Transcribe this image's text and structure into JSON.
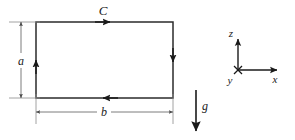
{
  "figure": {
    "type": "physics-diagram",
    "background_color": "#ffffff",
    "line_color": "#1a1a1a",
    "dimension_line_color": "#6e6e6e",
    "labels": {
      "contour": "C",
      "height": "a",
      "width": "b",
      "gravity": "g",
      "axis_z": "z",
      "axis_x": "x",
      "axis_y": "y"
    },
    "contour": {
      "name": "C",
      "shape": "rectangle",
      "orientation": "counterclockwise",
      "left": 36,
      "right": 173,
      "top": 22,
      "bottom": 98,
      "arrow_directions": {
        "top": "right",
        "right": "down",
        "bottom": "left",
        "left": "up"
      }
    },
    "dimensions": [
      {
        "name": "a",
        "axis": "vertical",
        "label": "a",
        "from": 22,
        "to": 98,
        "position": 21
      },
      {
        "name": "b",
        "axis": "horizontal",
        "label": "b",
        "from": 36,
        "to": 173,
        "position": 112
      }
    ],
    "gravity": {
      "label": "g",
      "direction": "down",
      "x": 196,
      "y_start": 90,
      "y_end": 132
    },
    "axes": {
      "origin_x": 238,
      "origin_y": 70,
      "z": {
        "label": "z",
        "direction": "up",
        "length": 33
      },
      "x": {
        "label": "x",
        "direction": "right",
        "length": 40
      },
      "y": {
        "label": "y",
        "direction": "out-of-page",
        "marker": "cross"
      }
    }
  }
}
